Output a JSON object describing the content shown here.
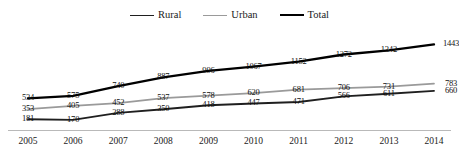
{
  "legend": {
    "position": "top-center",
    "items": [
      {
        "label": "Rural",
        "color": "#1f1f1f",
        "width": 1.6
      },
      {
        "label": "Urban",
        "color": "#9a9a9a",
        "width": 1.6
      },
      {
        "label": "Total",
        "color": "#000000",
        "width": 2.4
      }
    ]
  },
  "axis": {
    "tick_labels": [
      "2005",
      "2006",
      "2007",
      "2008",
      "2009",
      "2010",
      "2011",
      "2012",
      "2013",
      "2014"
    ]
  },
  "chart_data": {
    "type": "line",
    "title": "",
    "subtitle": "",
    "xlabel": "",
    "ylabel": "",
    "grid": false,
    "legend_position": "top-center",
    "x": [
      "2005",
      "2006",
      "2007",
      "2008",
      "2009",
      "2010",
      "2011",
      "2012",
      "2013",
      "2014"
    ],
    "categories": [
      "2005",
      "2006",
      "2007",
      "2008",
      "2009",
      "2010",
      "2011",
      "2012",
      "2013",
      "2014"
    ],
    "ylim": [
      0,
      1550
    ],
    "series": [
      {
        "name": "Total",
        "color": "#000000",
        "values": [
          534,
          575,
          740,
          887,
          996,
          1067,
          1152,
          1272,
          1342,
          1443
        ],
        "labels": [
          "534",
          "575",
          "740",
          "887",
          "996",
          "1067",
          "1152",
          "1272",
          "1342",
          "1443"
        ]
      },
      {
        "name": "Urban",
        "color": "#9a9a9a",
        "values": [
          353,
          405,
          452,
          537,
          578,
          620,
          681,
          706,
          731,
          783
        ],
        "labels": [
          "353",
          "405",
          "452",
          "537",
          "578",
          "620",
          "681",
          "706",
          "731",
          "783"
        ]
      },
      {
        "name": "Rural",
        "color": "#1f1f1f",
        "values": [
          181,
          170,
          288,
          350,
          418,
          447,
          471,
          566,
          611,
          660
        ],
        "labels": [
          "181",
          "170",
          "288",
          "350",
          "418",
          "447",
          "471",
          "566",
          "611",
          "660"
        ]
      }
    ]
  }
}
